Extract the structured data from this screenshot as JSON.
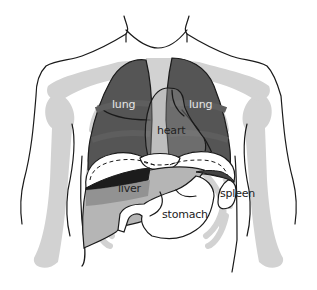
{
  "diagram": {
    "type": "anatomical-illustration",
    "labels": {
      "lung_left": "lung",
      "lung_right": "lung",
      "heart": "heart",
      "liver": "liver",
      "stomach": "stomach",
      "spleen": "spleen"
    },
    "colors": {
      "background": "#ffffff",
      "outline": "#1a1a1a",
      "skeleton": "#d2d2d2",
      "lung": "#555555",
      "lung_shade": "#4a4a4a",
      "liver_dark": "#1c1c1c",
      "liver_mid": "#8a8a8a",
      "liver_light": "#b5b5b5",
      "organ_white": "#ffffff",
      "lung_label_text": "#e6e6e6",
      "organ_label_text": "#222222"
    }
  }
}
